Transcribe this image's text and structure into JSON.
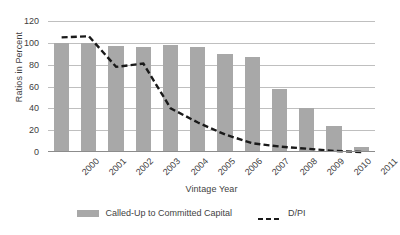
{
  "chart_data": {
    "type": "bar",
    "title": "",
    "xlabel": "Vintage Year",
    "ylabel": "Ratios in Percent",
    "categories": [
      "2000",
      "2001",
      "2002",
      "2003",
      "2004",
      "2005",
      "2006",
      "2007",
      "2008",
      "2009",
      "2010",
      "2011"
    ],
    "ylim": [
      0,
      120
    ],
    "yticks": [
      0,
      20,
      40,
      60,
      80,
      100,
      120
    ],
    "grid": true,
    "legend_position": "bottom",
    "series": [
      {
        "name": "Called-Up to Committed Capital",
        "type": "bar",
        "color": "#a8a8a8",
        "values": [
          100,
          100,
          97,
          96,
          98,
          96,
          90,
          87,
          58,
          40,
          24,
          5
        ]
      },
      {
        "name": "D/PI",
        "type": "line",
        "style": "dashed",
        "color": "#1a1a1a",
        "values": [
          105,
          106,
          78,
          81,
          40,
          27,
          16,
          8,
          5,
          3,
          1,
          0
        ]
      }
    ]
  },
  "axis": {
    "y_title": "Ratios in Percent",
    "x_title": "Vintage Year"
  },
  "legend": {
    "items": [
      {
        "label": "Called-Up to Committed Capital",
        "marker": "bar-swatch"
      },
      {
        "label": "D/PI",
        "marker": "dashed-line-swatch"
      }
    ]
  }
}
